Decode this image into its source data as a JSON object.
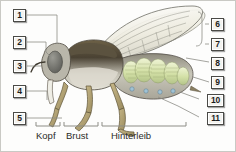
{
  "diagram": {
    "language": "de",
    "background_color": "#fdfdfc",
    "frame_color": "#c9c9c4"
  },
  "callouts": {
    "left": [
      {
        "number": "1",
        "x": 13,
        "y": 9
      },
      {
        "number": "2",
        "x": 13,
        "y": 36
      },
      {
        "number": "3",
        "x": 13,
        "y": 60
      },
      {
        "number": "4",
        "x": 13,
        "y": 85
      },
      {
        "number": "5",
        "x": 13,
        "y": 112
      }
    ],
    "right": [
      {
        "number": "6",
        "x": 211,
        "y": 18
      },
      {
        "number": "7",
        "x": 211,
        "y": 38
      },
      {
        "number": "8",
        "x": 211,
        "y": 57
      },
      {
        "number": "9",
        "x": 211,
        "y": 76
      },
      {
        "number": "10",
        "x": 207,
        "y": 94
      },
      {
        "number": "11",
        "x": 207,
        "y": 112
      }
    ]
  },
  "region_labels": [
    {
      "text": "Kopf",
      "x": 45,
      "y": 134
    },
    {
      "text": "Brust",
      "x": 78,
      "y": 134
    },
    {
      "text": "Hinterleib",
      "x": 126,
      "y": 134
    }
  ],
  "illustration": {
    "name": "honey-bee-lateral-cutaway",
    "colors": {
      "wing_fill": "#f2f1e6",
      "wing_vein": "#8e8e84",
      "thorax_dark": "#4a4233",
      "thorax_light": "#cfccc0",
      "head_eye": "#6e6e69",
      "abdomen_organ": "#d7e2ae",
      "abdomen_shell": "#b9b7ab",
      "leg": "#b2a173",
      "spiracle": "#9fc2d4",
      "outline": "#3a362c"
    }
  }
}
